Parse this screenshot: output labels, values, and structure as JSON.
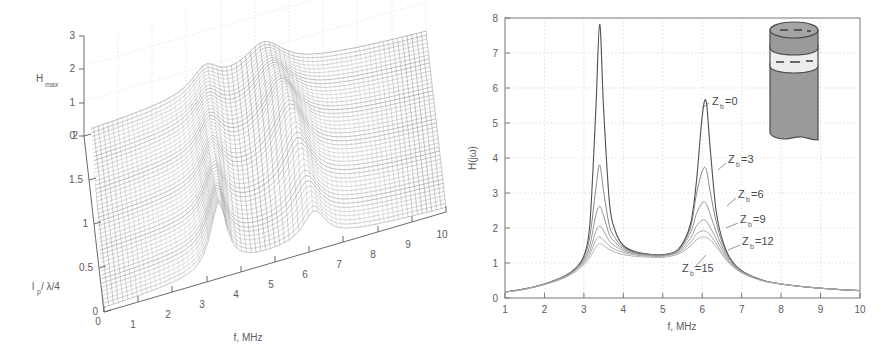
{
  "figure": {
    "background": "#ffffff",
    "ink": "#5c5c5c"
  },
  "panel_left": {
    "name": "3d-surface-plot",
    "axes": {
      "z_label": "H",
      "z_label_sub": "max",
      "z_ticks": [
        "0",
        "1",
        "2",
        "3"
      ],
      "y_label": "l",
      "y_label_sub": "p",
      "y_label_tail": " / λ/4",
      "y_ticks": [
        "0",
        "0.5",
        "1",
        "1.5",
        "2"
      ],
      "x_label": "f, MHz",
      "x_ticks": [
        "0",
        "1",
        "2",
        "3",
        "4",
        "5",
        "6",
        "7",
        "8",
        "9",
        "10"
      ]
    }
  },
  "panel_right": {
    "name": "frequency-response-plot",
    "axes": {
      "y_label": "H(jω)",
      "y_ticks": [
        "0",
        "1",
        "2",
        "3",
        "4",
        "5",
        "6",
        "7",
        "8"
      ],
      "x_label": "f, MHz",
      "x_ticks": [
        "1",
        "2",
        "3",
        "4",
        "5",
        "6",
        "7",
        "8",
        "9",
        "10"
      ]
    },
    "curve_labels": [
      {
        "text": "Z",
        "sub": "b",
        "tail": "=0",
        "x": 262,
        "y": 105
      },
      {
        "text": "Z",
        "sub": "b",
        "tail": "=3",
        "x": 278,
        "y": 163
      },
      {
        "text": "Z",
        "sub": "b",
        "tail": "=6",
        "x": 288,
        "y": 198
      },
      {
        "text": "Z",
        "sub": "b",
        "tail": "=9",
        "x": 290,
        "y": 223
      },
      {
        "text": "Z",
        "sub": "b",
        "tail": "=12",
        "x": 292,
        "y": 245
      },
      {
        "text": "Z",
        "sub": "b",
        "tail": "=15",
        "x": 232,
        "y": 272
      }
    ],
    "inset": {
      "name": "rod-with-bond-layer-diagram",
      "body_color": "#9a9a9a",
      "band_color": "#ededed",
      "outline_color": "#4a4a4a"
    }
  },
  "chart_data": [
    {
      "type": "line",
      "panel": "a",
      "title": "",
      "xlabel": "f, MHz",
      "ylabel": "H_max",
      "zlabel": "l_p / λ/4",
      "xlim": [
        0,
        10
      ],
      "ylim": [
        0,
        3
      ],
      "zlim": [
        0,
        2
      ],
      "grid": true,
      "note": "3D mesh surface of H_max versus frequency f and normalised bond depth l_p/(λ/4); diagonal resonance ridges run across the surface, amplitude peaks near 2.1",
      "surface_peaks": [
        {
          "f": 3.4,
          "lp": 0.2,
          "h": 2.1
        },
        {
          "f": 6.1,
          "lp": 1.0,
          "h": 1.6
        },
        {
          "f": 1.2,
          "lp": 2.0,
          "h": 1.4
        }
      ]
    },
    {
      "type": "line",
      "panel": "b",
      "title": "",
      "xlabel": "f, MHz",
      "ylabel": "H(jω)",
      "xlim": [
        1,
        10
      ],
      "ylim": [
        0,
        8
      ],
      "grid": true,
      "legend_position": "inline-annotations",
      "x": [
        1,
        1.5,
        2,
        2.5,
        2.8,
        3.0,
        3.15,
        3.3,
        3.4,
        3.5,
        3.65,
        3.8,
        4,
        4.3,
        4.6,
        5,
        5.4,
        5.7,
        5.85,
        6.0,
        6.1,
        6.2,
        6.35,
        6.5,
        6.7,
        7,
        7.5,
        8,
        8.5,
        9,
        9.5,
        10
      ],
      "series": [
        {
          "name": "Z_b=0",
          "values": [
            0.17,
            0.26,
            0.4,
            0.62,
            0.86,
            1.2,
            2.1,
            5.3,
            7.82,
            5.4,
            2.7,
            1.9,
            1.5,
            1.32,
            1.26,
            1.24,
            1.4,
            2.1,
            3.3,
            5.2,
            5.62,
            4.3,
            2.5,
            1.7,
            1.15,
            0.78,
            0.52,
            0.4,
            0.33,
            0.28,
            0.24,
            0.21
          ]
        },
        {
          "name": "Z_b=3",
          "values": [
            0.17,
            0.26,
            0.4,
            0.62,
            0.85,
            1.15,
            1.75,
            3.1,
            3.8,
            3.05,
            2.05,
            1.7,
            1.45,
            1.3,
            1.25,
            1.23,
            1.38,
            2.0,
            2.95,
            3.62,
            3.68,
            3.05,
            2.2,
            1.6,
            1.12,
            0.77,
            0.52,
            0.4,
            0.33,
            0.28,
            0.24,
            0.21
          ]
        },
        {
          "name": "Z_b=6",
          "values": [
            0.17,
            0.26,
            0.4,
            0.61,
            0.84,
            1.1,
            1.5,
            2.35,
            2.62,
            2.35,
            1.8,
            1.58,
            1.4,
            1.28,
            1.24,
            1.22,
            1.36,
            1.85,
            2.4,
            2.72,
            2.7,
            2.4,
            1.9,
            1.48,
            1.08,
            0.76,
            0.51,
            0.4,
            0.33,
            0.28,
            0.24,
            0.21
          ]
        },
        {
          "name": "Z_b=9",
          "values": [
            0.17,
            0.26,
            0.39,
            0.6,
            0.82,
            1.05,
            1.35,
            1.9,
            2.05,
            1.92,
            1.62,
            1.48,
            1.35,
            1.26,
            1.22,
            1.21,
            1.33,
            1.7,
            2.05,
            2.22,
            2.2,
            2.02,
            1.7,
            1.38,
            1.04,
            0.75,
            0.51,
            0.4,
            0.33,
            0.28,
            0.24,
            0.21
          ]
        },
        {
          "name": "Z_b=12",
          "values": [
            0.17,
            0.25,
            0.39,
            0.59,
            0.8,
            1.0,
            1.25,
            1.65,
            1.75,
            1.66,
            1.48,
            1.38,
            1.3,
            1.23,
            1.2,
            1.19,
            1.3,
            1.58,
            1.82,
            1.92,
            1.9,
            1.8,
            1.56,
            1.3,
            1.0,
            0.73,
            0.5,
            0.4,
            0.33,
            0.28,
            0.24,
            0.21
          ]
        },
        {
          "name": "Z_b=15",
          "values": [
            0.17,
            0.25,
            0.38,
            0.57,
            0.76,
            0.95,
            1.15,
            1.45,
            1.55,
            1.5,
            1.38,
            1.3,
            1.24,
            1.19,
            1.17,
            1.16,
            1.26,
            1.48,
            1.66,
            1.74,
            1.73,
            1.66,
            1.47,
            1.25,
            0.97,
            0.72,
            0.5,
            0.4,
            0.33,
            0.28,
            0.24,
            0.21
          ]
        }
      ]
    }
  ]
}
